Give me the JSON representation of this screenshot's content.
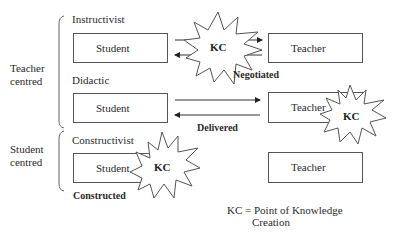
{
  "diagram": {
    "groups": [
      {
        "label_line1": "Teacher",
        "label_line2": "centred"
      },
      {
        "label_line1": "Student",
        "label_line2": "centred"
      }
    ],
    "rows": [
      {
        "title": "Instructivist",
        "left_box": "Student",
        "right_box": "Teacher",
        "kc_position": "between",
        "arrow_label": "Negotiated",
        "arrows": [
          "student-to-teacher",
          "teacher-to-student"
        ]
      },
      {
        "title": "Didactic",
        "left_box": "Student",
        "right_box": "Teacher",
        "kc_position": "teacher",
        "arrow_label": "Delivered",
        "arrows": [
          "student-to-teacher",
          "teacher-to-student"
        ]
      },
      {
        "title": "Constructivist",
        "left_box": "Student",
        "right_box": "Teacher",
        "kc_position": "student",
        "arrow_label": "Constructed",
        "arrows": []
      }
    ],
    "kc_label": "KC",
    "legend": {
      "line1": "KC = Point of Knowledge",
      "line2": "Creation"
    }
  }
}
